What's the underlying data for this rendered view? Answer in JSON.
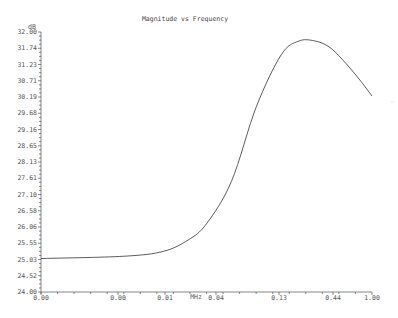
{
  "chart_data": {
    "type": "line",
    "title": "Magnitude vs Frequency",
    "xlabel": "MHz",
    "ylabel": "dB",
    "ylim": [
      24.0,
      32.0
    ],
    "xscale": "log",
    "y_ticks": [
      "32.00",
      "31.74",
      "31.23",
      "30.71",
      "30.19",
      "29.68",
      "29.16",
      "28.65",
      "28.13",
      "27.61",
      "27.10",
      "26.58",
      "26.06",
      "25.55",
      "25.03",
      "24.52",
      "24.00"
    ],
    "x_tick_labels": [
      {
        "label": "0.00",
        "px": 41
      },
      {
        "label": "0.00",
        "px": 118
      },
      {
        "label": "0.01",
        "px": 165
      },
      {
        "label": "0.04",
        "px": 216
      },
      {
        "label": "0.13",
        "px": 279
      },
      {
        "label": "0.44",
        "px": 333
      },
      {
        "label": "1.00",
        "px": 372
      }
    ],
    "series": [
      {
        "name": "Magnitude",
        "color": "#333333",
        "x": [
          0.0001,
          0.001,
          0.003,
          0.006,
          0.01,
          0.02,
          0.04,
          0.08,
          0.13,
          0.2,
          0.3,
          0.44,
          0.7,
          1.0
        ],
        "values": [
          25.03,
          25.1,
          25.25,
          25.6,
          26.1,
          27.4,
          29.7,
          31.3,
          31.72,
          31.73,
          31.55,
          31.15,
          30.55,
          30.03
        ]
      }
    ],
    "grid": false,
    "legend": "none"
  },
  "labels": {
    "title": "Magnitude vs Frequency",
    "y_unit": "dB",
    "x_unit": "MHz"
  }
}
